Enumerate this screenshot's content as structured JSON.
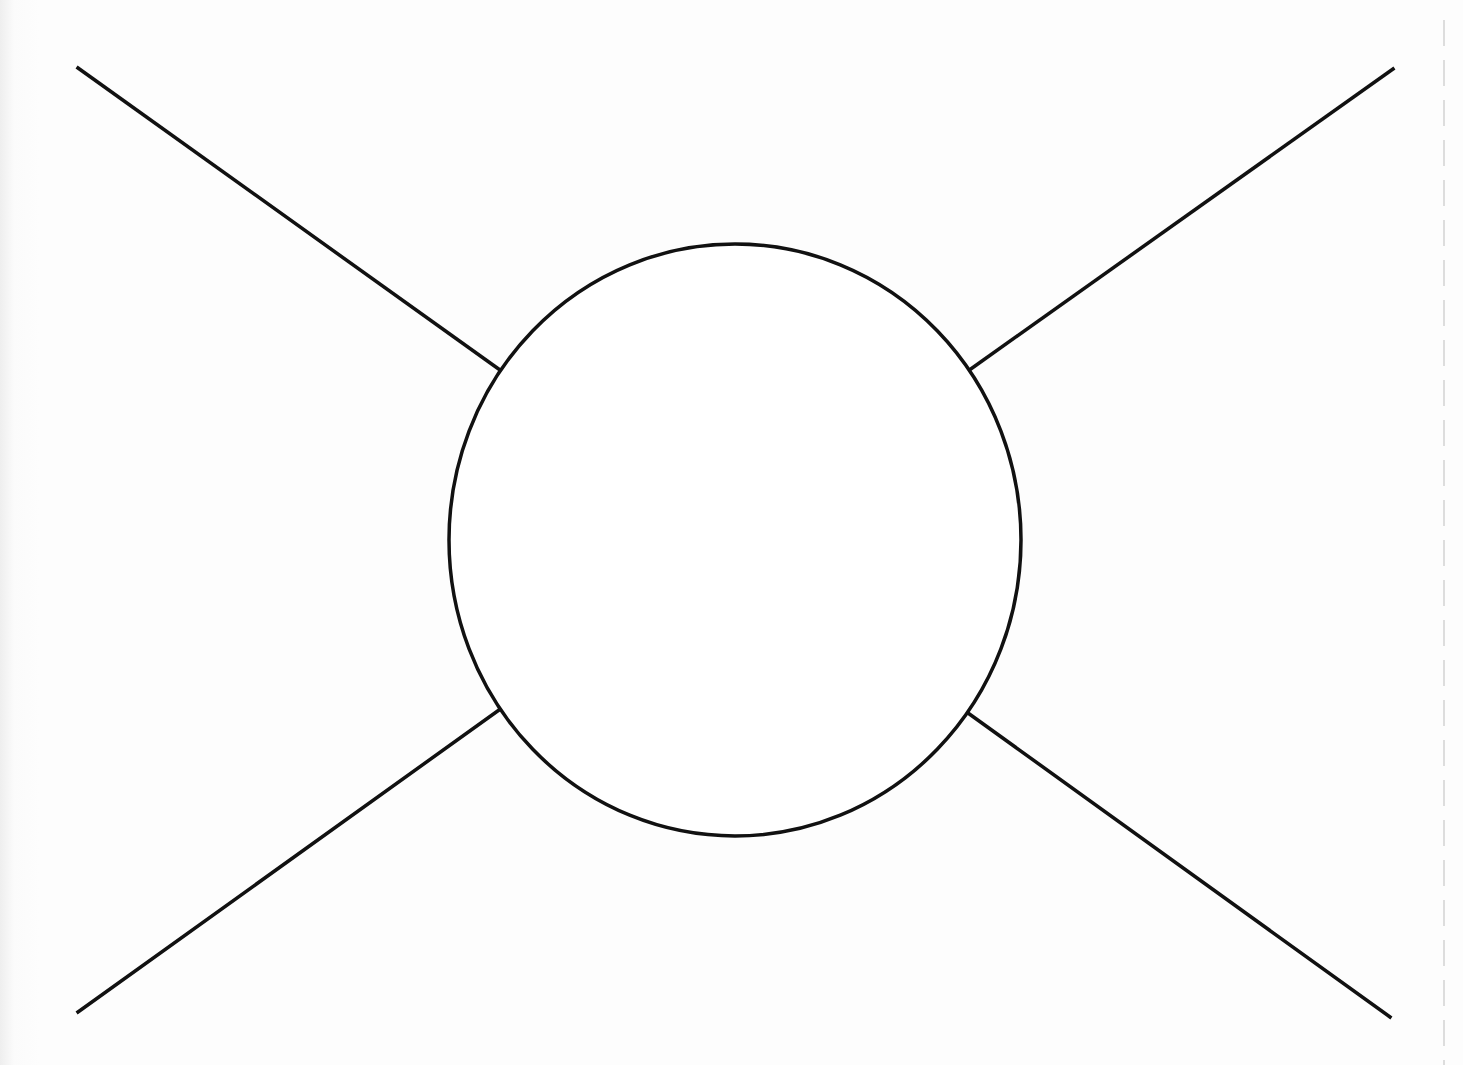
{
  "diagram": {
    "type": "blob-vertex",
    "stroke_color": "#111111",
    "background_color": "#fdfdfd",
    "stroke_width": 3.5,
    "circle": {
      "cx": 735,
      "cy": 540,
      "rx": 286,
      "ry": 296
    },
    "legs": [
      {
        "name": "top-left",
        "x1": 78,
        "y1": 68,
        "x2": 500,
        "y2": 370
      },
      {
        "name": "top-right",
        "x1": 1393,
        "y1": 69,
        "x2": 968,
        "y2": 371
      },
      {
        "name": "bottom-left",
        "x1": 78,
        "y1": 1012,
        "x2": 499,
        "y2": 710
      },
      {
        "name": "bottom-right",
        "x1": 1390,
        "y1": 1017,
        "x2": 968,
        "y2": 713
      }
    ],
    "edge_guide": {
      "x": 1444,
      "y1": 20,
      "y2": 1065,
      "color": "#c8c8c8"
    }
  }
}
